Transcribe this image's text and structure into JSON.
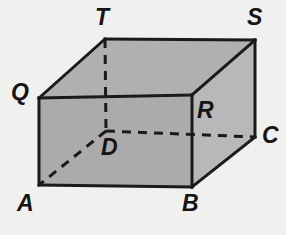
{
  "figure": {
    "name": "rectangular-prism-labeled-vertices",
    "background_color": "#f0f0ee",
    "line_color": "#1a1a1a",
    "label_color": "#141414",
    "faces": {
      "front_color": "#ababab",
      "top_color": "#b0b0b0",
      "right_color": "#b8b8b8"
    },
    "solid_edge_width": 3,
    "hidden_edge_width": 3,
    "hidden_edge_dash": "9 7",
    "vertices": [
      {
        "label": "T",
        "x": 105,
        "y": 39,
        "label_x": 95,
        "label_y": 6,
        "hidden": false
      },
      {
        "label": "S",
        "x": 255,
        "y": 40,
        "label_x": 247,
        "label_y": 6,
        "hidden": false
      },
      {
        "label": "Q",
        "x": 39,
        "y": 98,
        "label_x": 11,
        "label_y": 81,
        "hidden": false
      },
      {
        "label": "R",
        "x": 192,
        "y": 95,
        "label_x": 197,
        "label_y": 99,
        "hidden": false
      },
      {
        "label": "C",
        "x": 255,
        "y": 137,
        "label_x": 262,
        "label_y": 124,
        "hidden": false
      },
      {
        "label": "D",
        "x": 106,
        "y": 131,
        "label_x": 101,
        "label_y": 136,
        "hidden": true
      },
      {
        "label": "A",
        "x": 39,
        "y": 185,
        "label_x": 17,
        "label_y": 192,
        "hidden": false
      },
      {
        "label": "B",
        "x": 192,
        "y": 187,
        "label_x": 182,
        "label_y": 192,
        "hidden": false
      }
    ],
    "solid_edges": [
      {
        "from": "A",
        "to": "B"
      },
      {
        "from": "B",
        "to": "R"
      },
      {
        "from": "R",
        "to": "Q"
      },
      {
        "from": "Q",
        "to": "A"
      },
      {
        "from": "Q",
        "to": "T"
      },
      {
        "from": "T",
        "to": "S"
      },
      {
        "from": "S",
        "to": "R"
      },
      {
        "from": "S",
        "to": "C"
      },
      {
        "from": "C",
        "to": "B"
      }
    ],
    "hidden_edges": [
      {
        "from": "T",
        "to": "D"
      },
      {
        "from": "D",
        "to": "C"
      },
      {
        "from": "D",
        "to": "A"
      }
    ],
    "polygons": [
      {
        "name": "top-face",
        "points": "Q T S R",
        "fill_key": "top_color"
      },
      {
        "name": "right-face",
        "points": "R S C B",
        "fill_key": "right_color"
      },
      {
        "name": "front-face",
        "points": "A B R Q",
        "fill_key": "front_color"
      }
    ]
  }
}
